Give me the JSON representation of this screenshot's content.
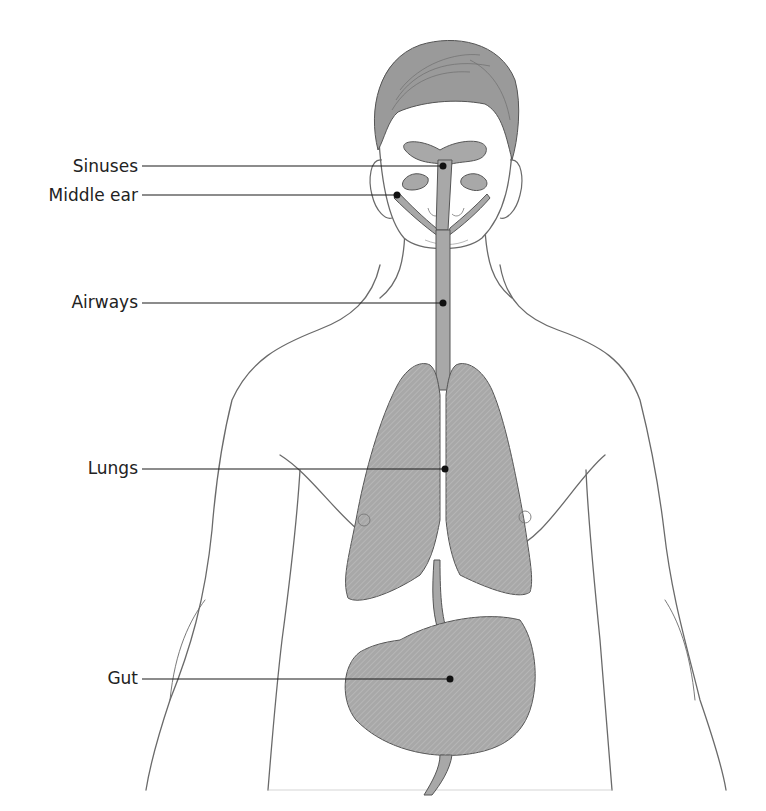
{
  "figure": {
    "type": "anatomical-diagram",
    "colors": {
      "background": "#ffffff",
      "organ_fill": "#a8a8a8",
      "organ_stroke": "#555555",
      "sketch_stroke": "#6a6a6a",
      "hair_fill": "#9a9a9a",
      "leader_line": "#1a1a1a",
      "label_text": "#222222"
    }
  },
  "labels": [
    {
      "id": "sinuses",
      "text": "Sinuses",
      "text_right": 138,
      "y": 167,
      "dot_x": 443,
      "dot_y": 166
    },
    {
      "id": "middle-ear",
      "text": "Middle ear",
      "text_right": 138,
      "y": 196,
      "dot_x": 397,
      "dot_y": 195
    },
    {
      "id": "airways",
      "text": "Airways",
      "text_right": 138,
      "y": 303,
      "dot_x": 443,
      "dot_y": 303
    },
    {
      "id": "lungs",
      "text": "Lungs",
      "text_right": 138,
      "y": 469,
      "dot_x": 445,
      "dot_y": 469
    },
    {
      "id": "gut",
      "text": "Gut",
      "text_right": 138,
      "y": 679,
      "dot_x": 450,
      "dot_y": 679
    }
  ]
}
